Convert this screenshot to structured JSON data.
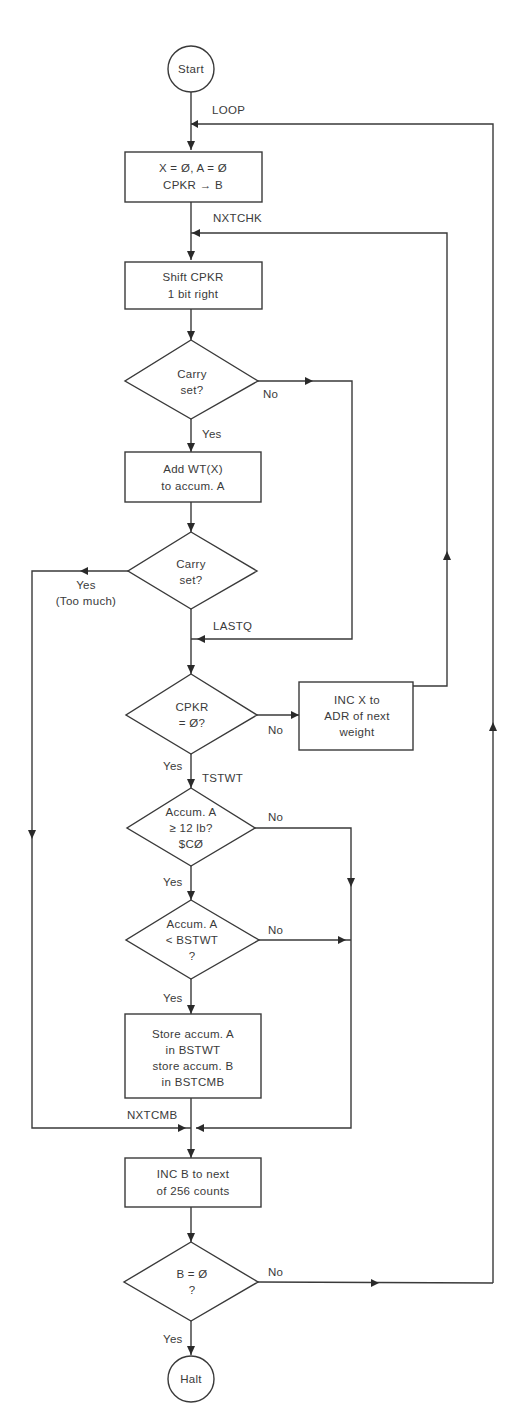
{
  "flowchart": {
    "terminals": {
      "start": "Start",
      "halt": "Halt"
    },
    "labels": {
      "loop": "LOOP",
      "nxtchk": "NXTCHK",
      "lastq": "LASTQ",
      "tstwt": "TSTWT",
      "nxtcmb": "NXTCMB"
    },
    "processes": {
      "init": [
        "X = Ø, A = Ø",
        "CPKR → B"
      ],
      "shift": [
        "Shift CPKR",
        "1 bit right"
      ],
      "add": [
        "Add WT(X)",
        "to accum. A"
      ],
      "inc_x": [
        "INC X to",
        "ADR of next",
        "weight"
      ],
      "store": [
        "Store accum. A",
        "in BSTWT",
        "store accum. B",
        "in BSTCMB"
      ],
      "inc_b": [
        "INC B to next",
        "of 256 counts"
      ]
    },
    "decisions": {
      "carry1": [
        "Carry",
        "set?"
      ],
      "carry2": [
        "Carry",
        "set?"
      ],
      "cpkr_zero": [
        "CPKR",
        "= Ø?"
      ],
      "accum_ge": [
        "Accum. A",
        "≥ 12 lb?",
        "$CØ"
      ],
      "accum_lt": [
        "Accum. A",
        "< BSTWT",
        "?"
      ],
      "b_zero": [
        "B = Ø",
        "?"
      ]
    },
    "branches": {
      "carry1_no": "No",
      "carry1_yes": "Yes",
      "carry2_yes": "Yes",
      "carry2_yes_note": "(Too much)",
      "cpkr_no": "No",
      "cpkr_yes": "Yes",
      "accum_ge_no": "No",
      "accum_ge_yes": "Yes",
      "accum_lt_no": "No",
      "accum_lt_yes": "Yes",
      "b_zero_no": "No",
      "b_zero_yes": "Yes"
    }
  }
}
